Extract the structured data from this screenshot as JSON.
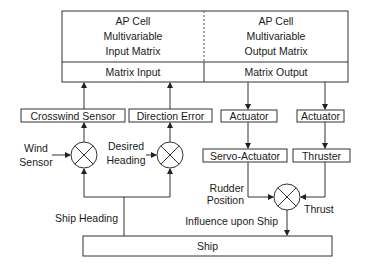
{
  "diagram": {
    "top_block": {
      "left": {
        "title_lines": [
          "AP Cell",
          "Multivariable",
          "Input Matrix"
        ],
        "port_label": "Matrix Input"
      },
      "right": {
        "title_lines": [
          "AP Cell",
          "Multivariable",
          "Output Matrix"
        ],
        "port_label": "Matrix Output"
      }
    },
    "boxes": {
      "crosswind_sensor": "Crosswind Sensor",
      "direction_error": "Direction Error",
      "actuator_1": "Actuator",
      "actuator_2": "Actuator",
      "servo_actuator": "Servo-Actuator",
      "thruster": "Thruster",
      "ship": "Ship"
    },
    "labels": {
      "wind_sensor": [
        "Wind",
        "Sensor"
      ],
      "desired_heading": [
        "Desired",
        "Heading"
      ],
      "rudder_position": [
        "Rudder",
        "Position"
      ],
      "thrust": "Thrust",
      "influence_upon_ship": "Influence upon Ship",
      "ship_heading": "Ship Heading"
    },
    "summing_junctions": [
      "wind-junction",
      "heading-junction",
      "influence-junction"
    ]
  }
}
